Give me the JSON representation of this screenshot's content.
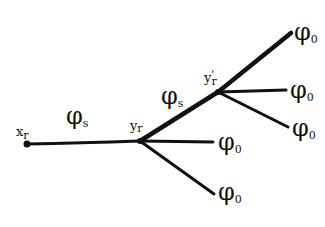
{
  "diagram": {
    "type": "tree",
    "stroke_color": "#111111",
    "background": "#ffffff",
    "nodes": {
      "root": {
        "label": "x",
        "sub": "r"
      },
      "v1": {
        "label": "y",
        "sub": "r"
      },
      "v2": {
        "label": "y",
        "sub": "r",
        "prime": "'"
      }
    },
    "edges": {
      "root_v1": {
        "label": "φ",
        "sub": "s"
      },
      "v1_v2": {
        "label": "φ",
        "sub": "s"
      },
      "v1_leaf1": {
        "label": "φ",
        "sub": "0"
      },
      "v1_leaf2": {
        "label": "φ",
        "sub": "0"
      },
      "v2_leaf1": {
        "label": "φ",
        "sub": "0"
      },
      "v2_leaf2": {
        "label": "φ",
        "sub": "0"
      },
      "v2_leaf3": {
        "label": "φ",
        "sub": "0"
      }
    }
  }
}
